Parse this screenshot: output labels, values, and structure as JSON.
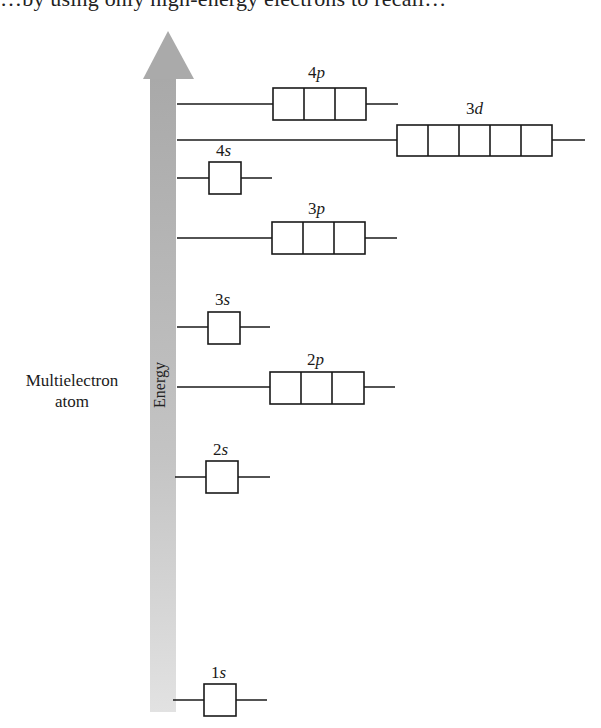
{
  "header_fragment": "…by using only high-energy electrons to recall…",
  "diagram": {
    "side_label": [
      "Multielectron",
      "atom"
    ],
    "axis_label": "Energy",
    "colors": {
      "arrow": "#b3b3b3",
      "line": "#1a1a1a",
      "box_fill": "#ffffff"
    },
    "orbitals": [
      {
        "n": "4",
        "l": "p",
        "boxes": 3
      },
      {
        "n": "3",
        "l": "d",
        "boxes": 5
      },
      {
        "n": "4",
        "l": "s",
        "boxes": 1
      },
      {
        "n": "3",
        "l": "p",
        "boxes": 3
      },
      {
        "n": "3",
        "l": "s",
        "boxes": 1
      },
      {
        "n": "2",
        "l": "p",
        "boxes": 3
      },
      {
        "n": "2",
        "l": "s",
        "boxes": 1
      },
      {
        "n": "1",
        "l": "s",
        "boxes": 1
      }
    ]
  }
}
